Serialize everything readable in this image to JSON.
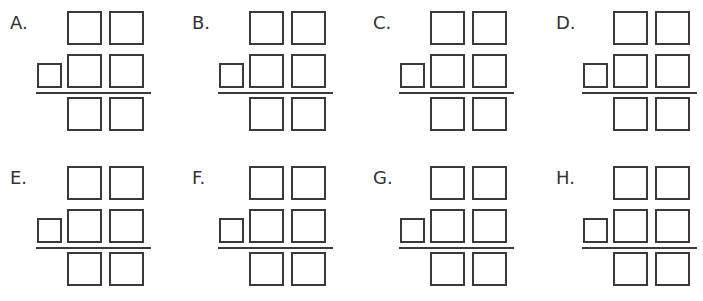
{
  "panels": [
    {
      "label": "A.",
      "x": 10,
      "y": 0
    },
    {
      "label": "B.",
      "x": 192,
      "y": 0
    },
    {
      "label": "C.",
      "x": 373,
      "y": 0
    },
    {
      "label": "D.",
      "x": 556,
      "y": 0
    },
    {
      "label": "E.",
      "x": 10,
      "y": 155
    },
    {
      "label": "F.",
      "x": 192,
      "y": 155
    },
    {
      "label": "G.",
      "x": 373,
      "y": 155
    },
    {
      "label": "H.",
      "x": 556,
      "y": 155
    }
  ],
  "layout": {
    "digit_columns": 2,
    "rows": [
      "top_addend",
      "bottom_addend",
      "sum"
    ],
    "carry_box": true,
    "stroke_color": "#3a3a3a"
  }
}
